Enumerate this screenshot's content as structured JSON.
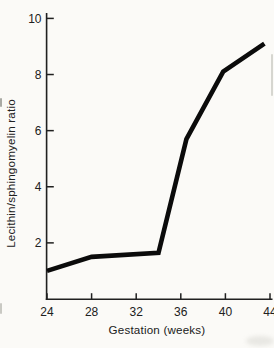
{
  "chart_data": {
    "type": "line",
    "xlabel": "Gestation (weeks)",
    "ylabel": "Lecithin/sphingomyelin ratio",
    "xlim": [
      24,
      44
    ],
    "ylim": [
      0,
      10
    ],
    "x_ticks": [
      24,
      28,
      32,
      36,
      40,
      44
    ],
    "y_ticks": [
      2,
      4,
      6,
      8,
      10
    ],
    "grid": false,
    "legend": false,
    "series": [
      {
        "x": [
          24,
          28,
          34,
          36.5,
          39.8,
          43.5
        ],
        "y": [
          1.0,
          1.5,
          1.65,
          5.7,
          8.1,
          9.1
        ]
      }
    ]
  },
  "style": {
    "paper_color": "#fbfaf7",
    "line_color": "#0b0b0b",
    "line_width": 4.6,
    "axis_color": "#202020",
    "text_color": "#202020"
  }
}
